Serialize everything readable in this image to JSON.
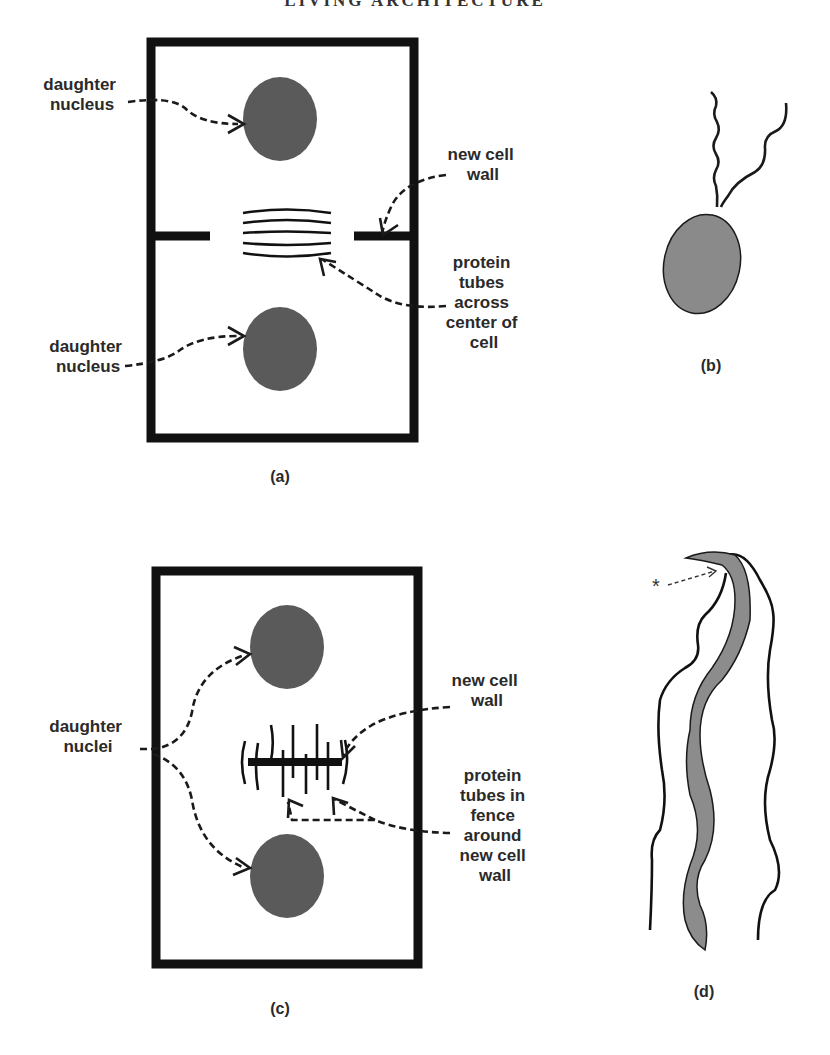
{
  "page": {
    "header": "LIVING ARCHITECTURE"
  },
  "panel_a": {
    "caption": "(a)",
    "labels": {
      "daughter_nucleus_top": [
        "daughter",
        "nucleus"
      ],
      "daughter_nucleus_bottom": [
        "daughter",
        "nucleus"
      ],
      "new_cell_wall": [
        "new cell",
        "wall"
      ],
      "protein_tubes": [
        "protein",
        "tubes",
        "across",
        "center of",
        "cell"
      ]
    }
  },
  "panel_b": {
    "caption": "(b)"
  },
  "panel_c": {
    "caption": "(c)",
    "labels": {
      "daughter_nuclei": [
        "daughter",
        "nuclei"
      ],
      "new_cell_wall": [
        "new cell",
        "wall"
      ],
      "protein_tubes": [
        "protein",
        "tubes in",
        "fence",
        "around",
        "new cell",
        "wall"
      ]
    }
  },
  "panel_d": {
    "caption": "(d)",
    "marker": "*"
  },
  "colors": {
    "wall": "#111111",
    "nucleus": "#5a5a5a",
    "cell_body": "#8a8a8a",
    "text": "#2a2a2a"
  }
}
